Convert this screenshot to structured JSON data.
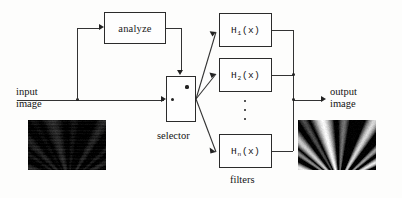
{
  "diagram": {
    "background_color": "#fdfdfc",
    "line_color": "#333333",
    "labels": {
      "input_line1": "input",
      "input_line2": "image",
      "output_line1": "output",
      "output_line2": "image",
      "selector": "selector",
      "filters": "filters",
      "analyze": "analyze"
    },
    "blocks": {
      "analyze": {
        "label": "analyze"
      },
      "selector": {
        "label": "selector"
      }
    },
    "filters": [
      {
        "name": "H",
        "subscript": "1",
        "arg": "(x)"
      },
      {
        "name": "H",
        "subscript": "2",
        "arg": "(x)"
      },
      {
        "name": "H",
        "subscript": "n",
        "arg": "(x)"
      }
    ],
    "ellipsis": "⋮",
    "thumbnails": {
      "input": {
        "name": "input-image-thumbnail",
        "description": "dark low-contrast image with faint diagonal streaks"
      },
      "output": {
        "name": "output-image-thumbnail",
        "description": "high-contrast image with bright diagonal wedges"
      }
    }
  }
}
